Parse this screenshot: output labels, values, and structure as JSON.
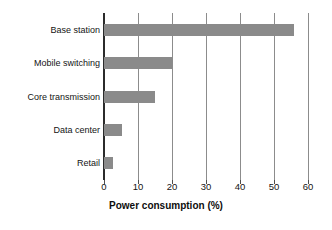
{
  "chart_data": {
    "type": "bar",
    "orientation": "horizontal",
    "title": "",
    "subtitle": "",
    "xlabel": "Power consumption (%)",
    "ylabel": "",
    "categories": [
      "Base station",
      "Mobile switching",
      "Core transmission",
      "Data center",
      "Retail"
    ],
    "values": [
      56,
      20,
      15,
      5.3,
      2.6
    ],
    "series": [
      {
        "name": "Power consumption",
        "values": [
          56,
          20,
          15,
          5.3,
          2.6
        ]
      }
    ],
    "xlim": [
      0,
      60
    ],
    "xticks": [
      0,
      10,
      20,
      30,
      40,
      50,
      60
    ],
    "xtick_labels": [
      "0",
      "10",
      "20",
      "30",
      "40",
      "50",
      "60"
    ],
    "grid": "vertical",
    "legend": "none",
    "annotations": [],
    "colors": {
      "bar_fill": "#8a8a8a",
      "gridline": "#8c8c8c",
      "axis": "#2b2b2b",
      "text": "#141414",
      "background": "#ffffff"
    }
  }
}
